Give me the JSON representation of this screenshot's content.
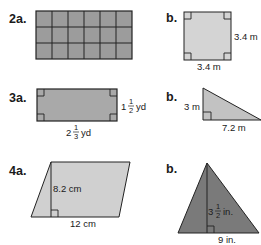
{
  "problems": [
    {
      "id": "2a",
      "label": "2a.",
      "shape": "grid-rectangle",
      "columns": 6,
      "rows": 3,
      "fill": "#9c9c9c"
    },
    {
      "id": "2b",
      "label": "b.",
      "shape": "square",
      "fill": "#d4d4d4",
      "side_label": "3.4 m",
      "bottom_label": "3.4 m"
    },
    {
      "id": "3a",
      "label": "3a.",
      "shape": "rectangle",
      "fill": "#a9a9a9",
      "side_whole": "1",
      "side_num": "1",
      "side_den": "2",
      "side_unit": "yd",
      "bottom_whole": "2",
      "bottom_num": "1",
      "bottom_den": "3",
      "bottom_unit": "yd"
    },
    {
      "id": "3b",
      "label": "b.",
      "shape": "right-triangle",
      "fill": "#c2c2c2",
      "height_label": "3 m",
      "base_label": "7.2 m"
    },
    {
      "id": "4a",
      "label": "4a.",
      "shape": "parallelogram",
      "fill": "#d0d0d0",
      "height_label": "8.2 cm",
      "base_label": "12 cm"
    },
    {
      "id": "4b",
      "label": "b.",
      "shape": "triangle",
      "fill": "#7a7a7a",
      "height_whole": "3",
      "height_num": "1",
      "height_den": "2",
      "height_unit": "in.",
      "base_label": "9 in."
    }
  ]
}
